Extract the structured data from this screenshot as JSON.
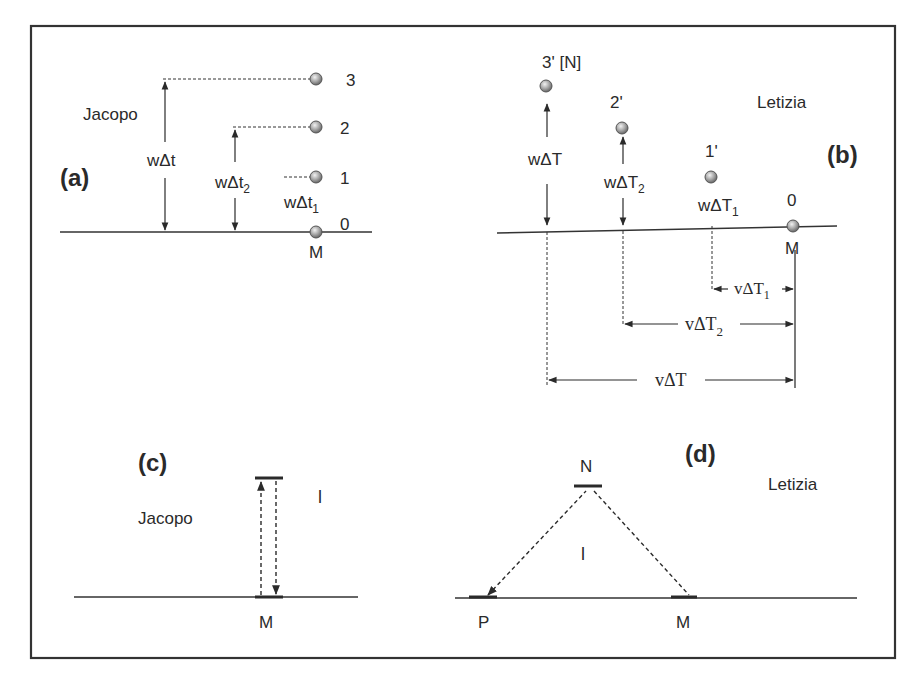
{
  "figure": {
    "panels": {
      "a": {
        "tag": "(a)",
        "observer": "Jacopo",
        "points": [
          {
            "label": "3"
          },
          {
            "label": "2"
          },
          {
            "label": "1"
          },
          {
            "label": "0"
          }
        ],
        "base_label": "M",
        "intervals": {
          "total": {
            "pre": "wΔt",
            "sub": ""
          },
          "t2": {
            "pre": "wΔt",
            "sub": "2"
          },
          "t1": {
            "pre": "wΔt",
            "sub": "1"
          }
        }
      },
      "b": {
        "tag": "(b)",
        "observer": "Letizia",
        "points": [
          {
            "label": "3' [N]"
          },
          {
            "label": "2'"
          },
          {
            "label": "1'"
          },
          {
            "label": "0"
          }
        ],
        "base_label": "M",
        "vertical_intervals": {
          "total": {
            "pre": "wΔT",
            "sub": ""
          },
          "T2": {
            "pre": "wΔT",
            "sub": "2"
          },
          "T1": {
            "pre": "wΔT",
            "sub": "1"
          }
        },
        "horizontal_intervals": {
          "T1": {
            "pre": "vΔT",
            "sub": "1"
          },
          "T2": {
            "pre": "vΔT",
            "sub": "2"
          },
          "total": {
            "pre": "vΔT",
            "sub": ""
          }
        }
      },
      "c": {
        "tag": "(c)",
        "observer": "Jacopo",
        "path_label": "l",
        "base_label": "M"
      },
      "d": {
        "tag": "(d)",
        "observer": "Letizia",
        "apex_label": "N",
        "path_label": "l",
        "left_label": "P",
        "right_label": "M"
      }
    },
    "colors": {
      "ink": "#2a2a2a",
      "frame": "#333333",
      "sphere_fill": "#a8a8a8",
      "sphere_edge": "#555555"
    }
  }
}
